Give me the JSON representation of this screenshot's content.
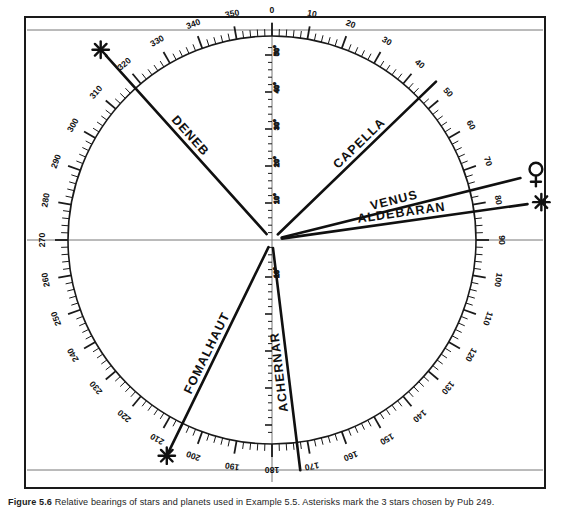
{
  "figure": {
    "kind": "relative-bearing-compass-diagram",
    "caption_label": "Figure",
    "caption_number": "5.6",
    "caption_text": "Relative bearings of stars and planets used in Example 5.5.  Asterisks mark the 3 stars chosen by Pub 249."
  },
  "chart_data": {
    "type": "polar-bearing",
    "title": "Relative bearings of stars and planets",
    "center": {
      "x": 272,
      "y": 240
    },
    "radius_outer": 216,
    "radius_ticks": 204,
    "azimuth_scale": {
      "name": "relative-bearing-ring",
      "units": "degrees",
      "range": [
        0,
        360
      ],
      "zero_at": "top",
      "direction": "clockwise",
      "major_step": 10,
      "minor_step": 2,
      "labels": [
        0,
        10,
        20,
        30,
        40,
        50,
        60,
        70,
        80,
        90,
        100,
        110,
        120,
        130,
        140,
        150,
        160,
        170,
        180,
        190,
        200,
        210,
        220,
        230,
        240,
        250,
        260,
        270,
        280,
        290,
        300,
        310,
        320,
        330,
        340,
        350
      ]
    },
    "altitude_scale": {
      "name": "vertical-altitude-scale",
      "units": "degrees",
      "orientation": "vertical",
      "labels": [
        "10°",
        "20°",
        "30°",
        "40°",
        "50°",
        "10°"
      ],
      "up_labels": [
        "10°",
        "20°",
        "30°",
        "40°",
        "50°"
      ],
      "down_labels": [
        "10°"
      ]
    },
    "bodies": [
      {
        "name": "DENEB",
        "label": "DENEB",
        "bearing_deg": 318,
        "marker": "asterisk",
        "marker_symbol": "✳",
        "selected": true,
        "line_beyond_circle": true
      },
      {
        "name": "CAPELLA",
        "label": "CAPELLA",
        "bearing_deg": 46,
        "marker": "none",
        "marker_symbol": "",
        "selected": false,
        "line_beyond_circle": true
      },
      {
        "name": "VENUS",
        "label": "VENUS",
        "bearing_deg": 76,
        "marker": "venus",
        "marker_symbol": "♀",
        "selected": false,
        "line_beyond_circle": true
      },
      {
        "name": "ALDEBARAN",
        "label": "ALDEBARAN",
        "bearing_deg": 82,
        "marker": "asterisk",
        "marker_symbol": "✳",
        "selected": true,
        "line_beyond_circle": true
      },
      {
        "name": "ACHERNAR",
        "label": "ACHERNAR",
        "bearing_deg": 173,
        "marker": "none",
        "marker_symbol": "",
        "selected": false,
        "line_beyond_circle": true
      },
      {
        "name": "FOMALHAUT",
        "label": "FOMALHAUT",
        "bearing_deg": 206,
        "marker": "asterisk",
        "marker_symbol": "✳",
        "selected": true,
        "line_beyond_circle": true
      }
    ],
    "guide_lines": [
      {
        "name": "top-horizontal-rule",
        "orientation": "horizontal"
      },
      {
        "name": "middle-horizontal-rule",
        "orientation": "horizontal"
      },
      {
        "name": "bottom-horizontal-rule",
        "orientation": "horizontal"
      },
      {
        "name": "center-vertical-rule",
        "orientation": "vertical"
      }
    ],
    "colors": {
      "ink": "#1a1a1a",
      "rule": "#6e6e6e",
      "background": "#ffffff"
    }
  }
}
